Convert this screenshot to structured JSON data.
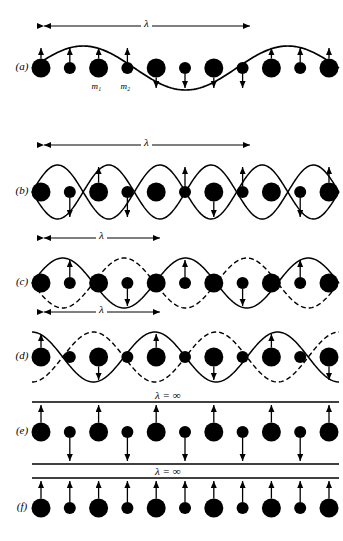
{
  "figure": {
    "width": 343,
    "height": 541,
    "ink_color": "#000000",
    "background": "#ffffff",
    "atom_large_label": "m₁",
    "atom_small_label": "m₂",
    "lambda_symbol": "λ",
    "lambda_infinite": "λ = ∞"
  },
  "panels": [
    {
      "id": "a",
      "label": "(a)",
      "lambda_label": "λ",
      "lambda_x_start": 44,
      "lambda_x_end": 250,
      "mode": "acoustic",
      "wave_kind": "single-solid-sine",
      "cycles": 1.5,
      "amplitude": 22,
      "baseline": 68,
      "mass_labels_shown": true,
      "mass_label_large": "m₁",
      "mass_label_small": "m₂",
      "arrows": [
        "up",
        "up",
        "up",
        "up",
        "down",
        "down",
        "down",
        "down",
        "up",
        "up",
        "up"
      ]
    },
    {
      "id": "b",
      "label": "(b)",
      "lambda_label": "λ",
      "lambda_x_start": 44,
      "lambda_x_end": 250,
      "mode": "acoustic-short",
      "wave_kind": "double-solid-sine-mirrored",
      "cycles": 3,
      "amplitude": 27,
      "baseline": 192,
      "mass_labels_shown": false,
      "arrows": [
        "none",
        "down",
        "up",
        "down",
        "none",
        "up",
        "down",
        "up",
        "none",
        "down",
        "up"
      ]
    },
    {
      "id": "c",
      "label": "(c)",
      "lambda_label": "λ",
      "lambda_x_start": 44,
      "lambda_x_end": 160,
      "mode": "optical",
      "wave_kind": "solid-plus-dashed",
      "cycles": 2.5,
      "amplitude": 25,
      "baseline": 283,
      "mass_labels_shown": false,
      "arrows": [
        "none",
        "up",
        "none",
        "down",
        "none",
        "up",
        "none",
        "down",
        "none",
        "up",
        "none"
      ]
    },
    {
      "id": "d",
      "label": "(d)",
      "lambda_label": "λ",
      "lambda_x_start": 44,
      "lambda_x_end": 160,
      "mode": "optical-shifted",
      "wave_kind": "solid-plus-dashed",
      "cycles": 2.5,
      "amplitude": 25,
      "baseline": 357,
      "mass_labels_shown": false,
      "arrows": [
        "up",
        "none",
        "down",
        "none",
        "up",
        "none",
        "down",
        "none",
        "up",
        "none",
        "down"
      ]
    },
    {
      "id": "e",
      "label": "(e)",
      "lambda_label": "λ = ∞",
      "mode": "optical-infinite",
      "wave_kind": "two-horizontal-lines",
      "baseline": 432,
      "line_top_offset": -30,
      "line_bottom_offset": 32,
      "mass_labels_shown": false,
      "arrows": [
        "up",
        "down",
        "up",
        "down",
        "up",
        "down",
        "up",
        "down",
        "up",
        "down",
        "up"
      ]
    },
    {
      "id": "f",
      "label": "(f)",
      "lambda_label": "λ = ∞",
      "mode": "acoustic-infinite",
      "wave_kind": "one-horizontal-line",
      "baseline": 508,
      "line_top_offset": -30,
      "mass_labels_shown": false,
      "arrows": [
        "up",
        "up",
        "up",
        "up",
        "up",
        "up",
        "up",
        "up",
        "up",
        "up",
        "up"
      ]
    }
  ],
  "lattice": {
    "atom_count": 11,
    "x_start": 41,
    "x_spacing": 28.8,
    "radius_large": 9.5,
    "radius_small": 6.0,
    "pattern": [
      "large",
      "small",
      "large",
      "small",
      "large",
      "small",
      "large",
      "small",
      "large",
      "small",
      "large"
    ]
  }
}
